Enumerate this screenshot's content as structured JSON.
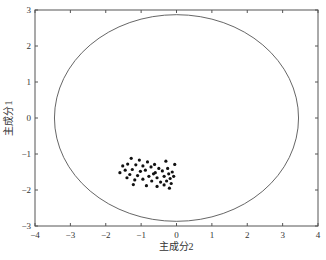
{
  "chart_data": {
    "type": "scatter",
    "title": "",
    "xlabel": "主成分2",
    "ylabel": "主成分1",
    "xlim": [
      -4,
      4
    ],
    "ylim": [
      -3,
      3
    ],
    "xticks": [
      -4,
      -3,
      -2,
      -1,
      0,
      1,
      2,
      3,
      4
    ],
    "yticks": [
      -3,
      -2,
      -1,
      0,
      1,
      2,
      3
    ],
    "grid": false,
    "legend": null,
    "boundary_ellipse": {
      "center": [
        0.0,
        0.0
      ],
      "rx": 3.45,
      "ry": 2.87,
      "color": "#555555"
    },
    "series": [
      {
        "name": "samples",
        "marker": "dot",
        "color": "#111111",
        "points": [
          [
            -1.28,
            -1.12
          ],
          [
            -1.05,
            -1.17
          ],
          [
            -0.82,
            -1.22
          ],
          [
            -0.62,
            -1.29
          ],
          [
            -0.3,
            -1.2
          ],
          [
            -0.05,
            -1.29
          ],
          [
            -1.52,
            -1.33
          ],
          [
            -1.38,
            -1.28
          ],
          [
            -1.15,
            -1.3
          ],
          [
            -0.95,
            -1.33
          ],
          [
            -0.72,
            -1.36
          ],
          [
            -0.5,
            -1.4
          ],
          [
            -1.45,
            -1.45
          ],
          [
            -1.25,
            -1.43
          ],
          [
            -1.02,
            -1.48
          ],
          [
            -0.88,
            -1.45
          ],
          [
            -0.6,
            -1.52
          ],
          [
            -0.4,
            -1.47
          ],
          [
            -0.22,
            -1.55
          ],
          [
            -0.12,
            -1.5
          ],
          [
            -1.6,
            -1.52
          ],
          [
            -1.32,
            -1.57
          ],
          [
            -1.1,
            -1.6
          ],
          [
            -0.78,
            -1.62
          ],
          [
            -0.55,
            -1.66
          ],
          [
            -0.35,
            -1.62
          ],
          [
            -0.18,
            -1.68
          ],
          [
            -0.08,
            -1.62
          ],
          [
            -1.4,
            -1.66
          ],
          [
            -1.18,
            -1.72
          ],
          [
            -0.95,
            -1.7
          ],
          [
            -0.7,
            -1.75
          ],
          [
            -0.45,
            -1.78
          ],
          [
            -0.28,
            -1.75
          ],
          [
            -0.15,
            -1.82
          ],
          [
            -1.22,
            -1.85
          ],
          [
            -0.85,
            -1.88
          ],
          [
            -0.55,
            -1.9
          ],
          [
            -0.35,
            -1.86
          ],
          [
            -0.2,
            -1.95
          ],
          [
            -0.65,
            -1.55
          ],
          [
            -0.25,
            -1.4
          ]
        ]
      }
    ]
  }
}
